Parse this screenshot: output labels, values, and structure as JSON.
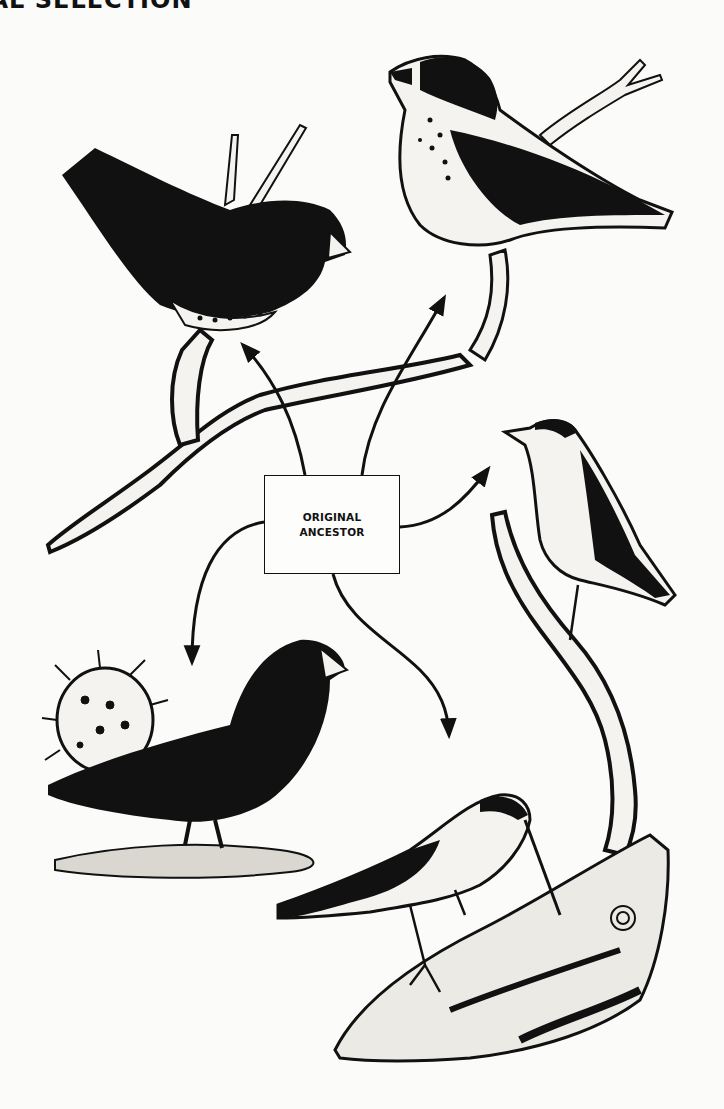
{
  "header": {
    "title_visible": "RAL SELECTION"
  },
  "diagram": {
    "center_node": {
      "line1": "ORIGINAL",
      "line2": "ANCESTOR"
    },
    "branches": [
      {
        "direction": "up-left",
        "target": "seed-eating finch (spotted breast) on branch"
      },
      {
        "direction": "up-right",
        "target": "large-beaked finch (spotted breast) on twig"
      },
      {
        "direction": "right",
        "target": "warbler-like finch on slender branch"
      },
      {
        "direction": "down-left",
        "target": "ground finch beside cactus"
      },
      {
        "direction": "down-right",
        "target": "long-billed finch probing bark"
      }
    ],
    "colors": {
      "ink": "#111111",
      "paper": "#fbfbfa"
    }
  }
}
